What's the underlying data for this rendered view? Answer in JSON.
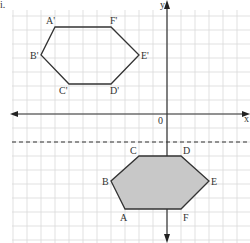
{
  "question_number": "i.",
  "axes": {
    "x_label": "x",
    "y_label": "y",
    "origin_label": "0"
  },
  "grid": {
    "cell_px": 14,
    "origin_px": [
      167,
      114
    ]
  },
  "image_shape": {
    "name": "A'B'C'D'E'F'",
    "vertices": [
      {
        "label": "A'",
        "px": [
          55,
          27
        ]
      },
      {
        "label": "F'",
        "px": [
          111,
          27
        ]
      },
      {
        "label": "E'",
        "px": [
          139,
          55
        ]
      },
      {
        "label": "D'",
        "px": [
          111,
          84
        ]
      },
      {
        "label": "C'",
        "px": [
          69,
          84
        ]
      },
      {
        "label": "B'",
        "px": [
          41,
          55
        ]
      }
    ]
  },
  "object_shape": {
    "name": "ABCDEF",
    "fill": "#c8c8c8",
    "vertices": [
      {
        "label": "C",
        "px": [
          139,
          156
        ]
      },
      {
        "label": "D",
        "px": [
          181,
          156
        ]
      },
      {
        "label": "E",
        "px": [
          209,
          181
        ]
      },
      {
        "label": "F",
        "px": [
          181,
          209
        ]
      },
      {
        "label": "A",
        "px": [
          125,
          209
        ]
      },
      {
        "label": "B",
        "px": [
          111,
          181
        ]
      }
    ]
  },
  "mirror_line": {
    "style": "dashed",
    "y_px": 142
  },
  "colors": {
    "grid": "#d9d9d9",
    "axis": "#333333",
    "shape": "#333333",
    "fill": "#c8c8c8"
  }
}
